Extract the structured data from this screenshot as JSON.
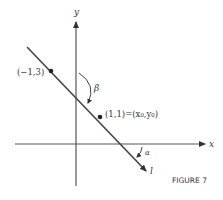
{
  "figure": {
    "caption": "FIGURE 7",
    "axes": {
      "x_label": "x",
      "y_label": "y"
    },
    "line": {
      "label": "l",
      "points": [
        {
          "label": "(−1,3)",
          "x": -1,
          "y": 3
        },
        {
          "label": "(1,1)=(x₀,y₀)",
          "x": 1,
          "y": 1
        }
      ]
    },
    "angles": {
      "beta": "β",
      "alpha": "α"
    },
    "colors": {
      "ink": "#333333",
      "line": "#555555"
    }
  }
}
